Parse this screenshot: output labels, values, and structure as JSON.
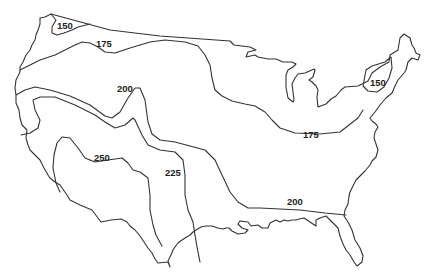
{
  "map": {
    "type": "contour-map",
    "region": "Contiguous United States",
    "colors": {
      "background": "#ffffff",
      "line": "#333333",
      "label": "#222222"
    },
    "contour_labels": [
      {
        "id": "c150-west",
        "value": "150",
        "x": 57,
        "y": 29
      },
      {
        "id": "c175-west",
        "value": "175",
        "x": 96,
        "y": 47
      },
      {
        "id": "c200-west",
        "value": "200",
        "x": 117,
        "y": 92
      },
      {
        "id": "c250",
        "value": "250",
        "x": 94,
        "y": 161
      },
      {
        "id": "c225",
        "value": "225",
        "x": 165,
        "y": 176
      },
      {
        "id": "c150-east",
        "value": "150",
        "x": 370,
        "y": 86
      },
      {
        "id": "c175-east",
        "value": "175",
        "x": 303,
        "y": 138
      },
      {
        "id": "c200-east",
        "value": "200",
        "x": 287,
        "y": 205
      }
    ]
  }
}
